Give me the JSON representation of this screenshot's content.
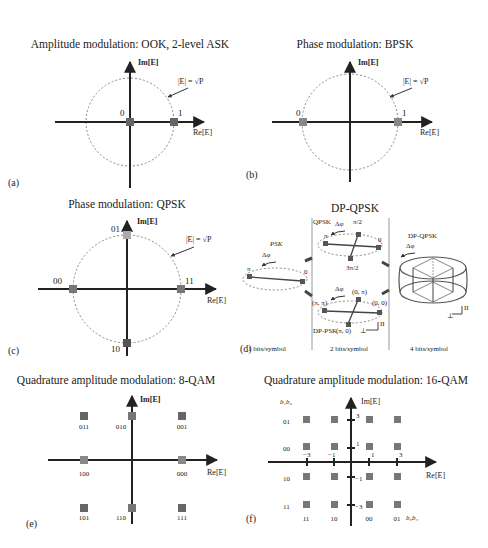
{
  "figure": {
    "panels": [
      {
        "id": "a",
        "label": "(a)",
        "title": "Amplitude modulation: OOK, 2-level ASK",
        "x_axis": "Re[E]",
        "y_axis": "Im[E]",
        "circle_label": "|E| = √P",
        "points": [
          {
            "label": "0",
            "re": 0,
            "im": 0
          },
          {
            "label": "1",
            "re": 1,
            "im": 0
          }
        ]
      },
      {
        "id": "b",
        "label": "(b)",
        "title": "Phase modulation: BPSK",
        "x_axis": "Re[E]",
        "y_axis": "Im[E]",
        "circle_label": "|E| = √P",
        "points": [
          {
            "label": "0",
            "re": -1,
            "im": 0
          },
          {
            "label": "1",
            "re": 1,
            "im": 0
          }
        ]
      },
      {
        "id": "c",
        "label": "(c)",
        "title": "Phase modulation: QPSK",
        "x_axis": "Re[E]",
        "y_axis": "Im[E]",
        "circle_label": "|E| = √P",
        "points": [
          {
            "label": "01",
            "re": 0,
            "im": 1
          },
          {
            "label": "00",
            "re": -1,
            "im": 0
          },
          {
            "label": "11",
            "re": 1,
            "im": 0
          },
          {
            "label": "10",
            "re": 0,
            "im": -1
          }
        ]
      },
      {
        "id": "d",
        "label": "(d)",
        "title": "DP-QPSK",
        "sections": [
          {
            "name": "PSK",
            "footer": "1 bits/symbol",
            "delta": "Δφ",
            "phase_labels": [
              "π",
              "0"
            ]
          },
          {
            "name": "QPSK",
            "footer": "2 bits/symbol",
            "delta": "Δφ",
            "phase_labels": [
              "π/2",
              "π",
              "0",
              "3π/2"
            ],
            "dp_psk": {
              "name": "DP-PSK",
              "delta": "Δφ",
              "phase_labels": [
                "(0, π)",
                "(π, π)",
                "(0, 0)",
                "(π, 0)"
              ],
              "pol_labels": [
                "⊥",
                "II"
              ]
            }
          },
          {
            "name": "DP-QPSK",
            "footer": "4 bits/symbol",
            "delta": "Δφ",
            "pol_labels": [
              "⊥",
              "II"
            ]
          }
        ]
      },
      {
        "id": "e",
        "label": "(e)",
        "title": "Quadrature amplitude modulation: 8-QAM",
        "x_axis": "Re[E]",
        "y_axis": "Im[E]",
        "points": [
          {
            "label": "011",
            "re": -1,
            "im": 1
          },
          {
            "label": "010",
            "re": 0,
            "im": 1
          },
          {
            "label": "001",
            "re": 1,
            "im": 1
          },
          {
            "label": "100",
            "re": -1,
            "im": 0
          },
          {
            "label": "000",
            "re": 1,
            "im": 0
          },
          {
            "label": "101",
            "re": -1,
            "im": -1
          },
          {
            "label": "110",
            "re": 0,
            "im": -1
          },
          {
            "label": "111",
            "re": 1,
            "im": -1
          }
        ]
      },
      {
        "id": "f",
        "label": "(f)",
        "title": "Quadrature amplitude modulation: 16-QAM",
        "x_axis": "Re[E]",
        "y_axis": "Im[E]",
        "row_bits_label": "b₁b₂",
        "col_bits_label": "b₃b₄",
        "x_ticks": [
          "−3",
          "−1",
          "1",
          "3"
        ],
        "y_ticks": [
          "3",
          "1",
          "−1",
          "−3"
        ],
        "row_labels": [
          "01",
          "00",
          "10",
          "11"
        ],
        "col_labels": [
          "11",
          "10",
          "00",
          "01"
        ],
        "levels": [
          -3,
          -1,
          1,
          3
        ]
      }
    ]
  }
}
